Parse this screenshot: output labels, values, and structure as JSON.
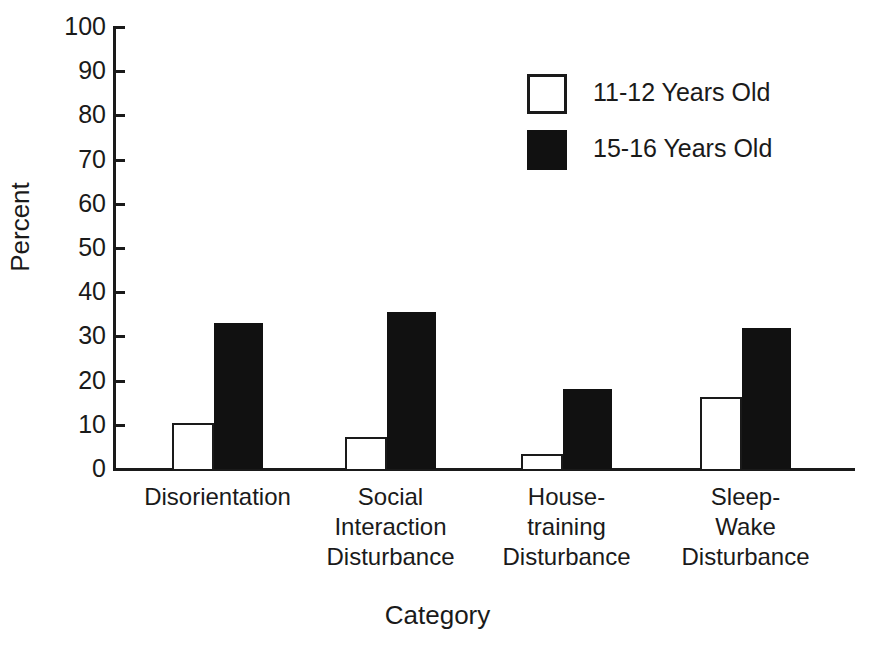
{
  "chart_data": {
    "type": "bar",
    "title": "",
    "xlabel": "Category",
    "ylabel": "Percent",
    "ylim": [
      0,
      100
    ],
    "ytick_step": 10,
    "yticks": [
      100,
      90,
      80,
      70,
      60,
      50,
      40,
      30,
      20,
      10,
      0
    ],
    "grid": false,
    "legend_position": "upper-center-right",
    "categories": [
      "Disorientation",
      "Social\nInteraction\nDisturbance",
      "House-\ntraining\nDisturbance",
      "Sleep-\nWake\nDisturbance"
    ],
    "series": [
      {
        "name": "11-12 Years Old",
        "style": "open",
        "color": "#ffffff",
        "edge_color": "#1a1a1a",
        "values": [
          10.5,
          7.3,
          3.3,
          16.3
        ]
      },
      {
        "name": "15-16 Years Old",
        "style": "filled",
        "color": "#111111",
        "edge_color": "#111111",
        "values": [
          33.0,
          35.5,
          18.0,
          32.0
        ]
      }
    ]
  },
  "legend": {
    "entries": [
      {
        "label": "11-12 Years Old",
        "swatch": "open-square-swatch"
      },
      {
        "label": "15-16 Years Old",
        "swatch": "filled-square-swatch"
      }
    ]
  },
  "axes": {
    "y_title": "Percent",
    "x_title": "Category",
    "y_tick_labels": [
      "100",
      "90",
      "80",
      "70",
      "60",
      "50",
      "40",
      "30",
      "20",
      "10",
      "0"
    ]
  },
  "colors": {
    "ink": "#1a1a1a",
    "fill": "#111111",
    "background": "#ffffff"
  }
}
